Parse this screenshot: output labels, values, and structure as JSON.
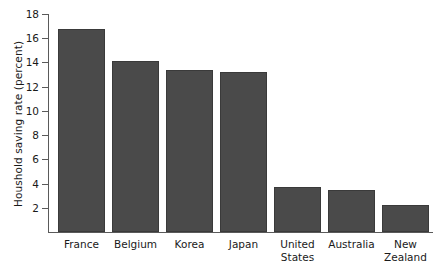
{
  "chart_data": {
    "type": "bar",
    "title": "",
    "xlabel": "",
    "ylabel": "Houshold saving rate (percent)",
    "categories": [
      "France",
      "Belgium",
      "Korea",
      "Japan",
      "United States",
      "Australia",
      "New Zealand"
    ],
    "values": [
      16.8,
      14.1,
      13.4,
      13.2,
      3.7,
      3.5,
      2.2
    ],
    "yticks": [
      2,
      4,
      6,
      8,
      10,
      12,
      14,
      16,
      18
    ],
    "ylim": [
      0,
      18
    ],
    "grid": false,
    "legend": null,
    "bar_color": "#4a4a4a",
    "axis_color": "#5a5a5a",
    "background_color": "#ffffff"
  }
}
